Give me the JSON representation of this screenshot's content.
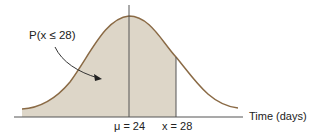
{
  "diagram": {
    "type": "normal-distribution",
    "probability_label": "P(x ≤ 28)",
    "mean_label": "μ = 24",
    "x_label": "x = 28",
    "axis_label": "Time (days)",
    "mean": 24,
    "x_value": 28,
    "colors": {
      "curve": "#8a6a45",
      "shade": "#ddd6c8",
      "axis": "#555555",
      "text": "#222222"
    }
  }
}
